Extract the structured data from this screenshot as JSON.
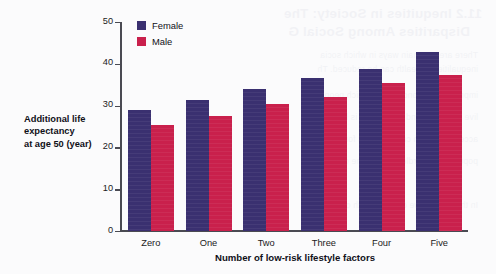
{
  "colors": {
    "female": "#3a3070",
    "male": "#c9204c",
    "axis": "#4a4a52",
    "background": "#fbfbfc"
  },
  "axis_label": {
    "line1": "Additional life",
    "line2": "expectancy",
    "line3": "at age 50 (year)"
  },
  "legend": {
    "female": "Female",
    "male": "Male"
  },
  "showthrough": {
    "line1": "11.2 Inequities in Society: The",
    "line2": "Disparities Among Social G",
    "line3": "There are two main ways in which socia",
    "line4": "inequalities in health can be reduced. Th",
    "line5": "improving the conditions in which peop",
    "line6": "live and work, and the second is by impr",
    "line7": "access to health care services for all gro",
    "line8": "population regardless of income or statu",
    "line9": "In this section we consider both of these"
  },
  "chart_data": {
    "type": "bar",
    "title": "",
    "xlabel": "Number of low-risk lifestyle factors",
    "ylabel": "Additional life expectancy at age 50 (year)",
    "categories": [
      "Zero",
      "One",
      "Two",
      "Three",
      "Four",
      "Five"
    ],
    "series": [
      {
        "name": "Female",
        "color": "#3a3070",
        "values": [
          29.0,
          31.4,
          34.0,
          36.6,
          38.8,
          42.9
        ]
      },
      {
        "name": "Male",
        "color": "#c9204c",
        "values": [
          25.4,
          27.6,
          30.3,
          32.1,
          35.3,
          37.4
        ]
      }
    ],
    "ylim": [
      0,
      50
    ],
    "yticks": [
      0,
      10,
      20,
      30,
      40,
      50
    ],
    "ytick_labels": [
      "0",
      "10",
      "20",
      "30",
      "40",
      "50"
    ],
    "grid": false,
    "legend_position": "top-left-inside"
  }
}
